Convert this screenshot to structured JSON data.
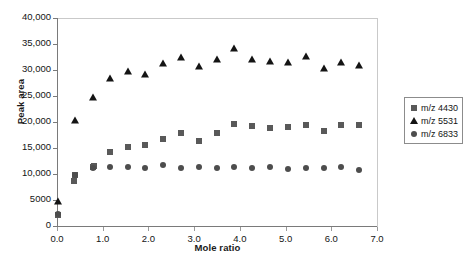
{
  "chart_data": {
    "type": "scatter",
    "title": "",
    "xlabel": "Mole ratio",
    "ylabel": "Peak area",
    "xlim": [
      0.0,
      7.0
    ],
    "ylim": [
      0,
      40000
    ],
    "xticks": [
      "0.0",
      "1.0",
      "2.0",
      "3.0",
      "4.0",
      "5.0",
      "6.0",
      "7.0"
    ],
    "xtick_values": [
      0.0,
      1.0,
      2.0,
      3.0,
      4.0,
      5.0,
      6.0,
      7.0
    ],
    "yticks": [
      "0",
      "5000",
      "10,000",
      "15,000",
      "20,000",
      "25,000",
      "30,000",
      "35,000",
      "40,000"
    ],
    "ytick_values": [
      0,
      5000,
      10000,
      15000,
      20000,
      25000,
      30000,
      35000,
      40000
    ],
    "grid": false,
    "legend_position": "right",
    "series": [
      {
        "name": "m/z 4430",
        "marker": "square",
        "color": "#595959",
        "x": [
          0.02,
          0.38,
          0.4,
          0.78,
          0.82,
          1.16,
          1.55,
          1.93,
          2.32,
          2.71,
          3.1,
          3.49,
          3.88,
          4.27,
          4.66,
          5.05,
          5.44,
          5.83,
          6.22,
          6.61
        ],
        "y": [
          2100,
          8600,
          9900,
          11300,
          11500,
          14300,
          15100,
          15500,
          16800,
          17800,
          16400,
          17900,
          19600,
          19200,
          18800,
          19100,
          19500,
          18300,
          19500,
          19400
        ]
      },
      {
        "name": "m/z 5531",
        "marker": "triangle",
        "color": "#141414",
        "x": [
          0.02,
          0.4,
          0.78,
          1.16,
          1.55,
          1.93,
          2.32,
          2.71,
          3.1,
          3.49,
          3.88,
          4.27,
          4.66,
          5.05,
          5.44,
          5.83,
          6.22,
          6.61
        ],
        "y": [
          4900,
          20300,
          24900,
          28400,
          29800,
          29200,
          31400,
          32500,
          30700,
          32200,
          34300,
          32100,
          31700,
          31600,
          32600,
          30400,
          31600,
          31000
        ]
      },
      {
        "name": "m/z 6833",
        "marker": "circle",
        "color": "#4d4d4d",
        "x": [
          0.02,
          0.4,
          0.78,
          1.16,
          1.55,
          1.93,
          2.32,
          2.71,
          3.1,
          3.49,
          3.88,
          4.27,
          4.66,
          5.05,
          5.44,
          5.83,
          6.22,
          6.61
        ],
        "y": [
          2400,
          9900,
          11200,
          11400,
          11400,
          11100,
          11700,
          11200,
          11300,
          11100,
          11400,
          11200,
          11400,
          11000,
          11200,
          11100,
          11300,
          10800
        ]
      }
    ]
  },
  "legend": {
    "items": [
      {
        "label": "m/z 4430",
        "marker": "square"
      },
      {
        "label": "m/z 5531",
        "marker": "triangle"
      },
      {
        "label": "m/z 6833",
        "marker": "circle"
      }
    ]
  }
}
